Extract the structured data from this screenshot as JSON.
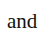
{
  "text": {
    "word": "and"
  },
  "colors": {
    "background": "#ffffff",
    "text": "#111111"
  }
}
